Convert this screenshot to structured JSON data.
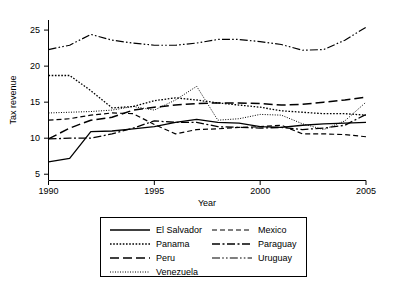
{
  "chart_data": {
    "type": "line",
    "title": "",
    "xlabel": "Year",
    "ylabel": "Tax revenue",
    "xlim": [
      1990,
      2005
    ],
    "ylim": [
      4.2,
      26.4
    ],
    "xticks": [
      1990,
      1995,
      2000,
      2005
    ],
    "yticks": [
      5,
      10,
      15,
      20,
      25
    ],
    "grid": false,
    "legend_position": "below-center",
    "x": [
      1990,
      1991,
      1992,
      1993,
      1994,
      1995,
      1996,
      1997,
      1998,
      1999,
      2000,
      2001,
      2002,
      2003,
      2004,
      2005
    ],
    "series": [
      {
        "name": "El Salvador",
        "style": "solid",
        "values": [
          6.7,
          7.2,
          10.9,
          11.0,
          11.3,
          11.6,
          12.2,
          12.6,
          12.2,
          12.1,
          11.6,
          11.5,
          11.8,
          12.0,
          12.1,
          12.2
        ]
      },
      {
        "name": "Panama",
        "style": "dotted",
        "values": [
          18.7,
          18.7,
          16.6,
          14.2,
          14.4,
          15.2,
          15.6,
          15.3,
          14.9,
          14.6,
          14.3,
          13.8,
          13.6,
          13.4,
          13.4,
          13.2
        ]
      },
      {
        "name": "Peru",
        "style": "long-dash",
        "values": [
          9.9,
          11.4,
          12.5,
          12.9,
          13.9,
          14.3,
          14.6,
          14.8,
          14.9,
          14.9,
          14.8,
          14.6,
          14.7,
          15.0,
          15.3,
          15.7
        ]
      },
      {
        "name": "Venezuela",
        "style": "fine-dotted",
        "values": [
          13.5,
          13.6,
          13.7,
          13.9,
          14.4,
          13.9,
          15.3,
          17.2,
          12.5,
          12.7,
          13.3,
          13.2,
          12.0,
          11.2,
          12.4,
          15.0
        ]
      },
      {
        "name": "Mexico",
        "style": "dashed",
        "values": [
          12.5,
          12.7,
          13.2,
          13.5,
          13.4,
          11.9,
          10.6,
          11.2,
          11.3,
          11.5,
          11.6,
          11.8,
          10.6,
          10.6,
          10.5,
          10.2
        ]
      },
      {
        "name": "Paraguay",
        "style": "dash-dot",
        "values": [
          9.9,
          10.0,
          10.0,
          10.6,
          11.4,
          12.4,
          12.2,
          12.2,
          11.6,
          11.5,
          11.4,
          11.5,
          11.2,
          11.4,
          11.8,
          13.3
        ]
      },
      {
        "name": "Uruguay",
        "style": "dash-dot-dot",
        "values": [
          22.3,
          22.9,
          24.4,
          23.6,
          23.2,
          22.9,
          22.9,
          23.2,
          23.7,
          23.7,
          23.4,
          23.0,
          22.2,
          22.3,
          23.6,
          25.4
        ]
      }
    ],
    "legend": [
      {
        "label": "El Salvador",
        "style": "solid"
      },
      {
        "label": "Mexico",
        "style": "dashed"
      },
      {
        "label": "Panama",
        "style": "dotted"
      },
      {
        "label": "Paraguay",
        "style": "dash-dot"
      },
      {
        "label": "Peru",
        "style": "long-dash"
      },
      {
        "label": "Uruguay",
        "style": "dash-dot-dot"
      },
      {
        "label": "Venezuela",
        "style": "fine-dotted"
      }
    ]
  },
  "axes": {
    "ylabel": "Tax revenue",
    "xlabel": "Year",
    "yticks": [
      "25",
      "20",
      "15",
      "10",
      "5"
    ],
    "xticks": [
      "1990",
      "1995",
      "2000",
      "2005"
    ]
  },
  "legend": {
    "entries": [
      "El Salvador",
      "Mexico",
      "Panama",
      "Paraguay",
      "Peru",
      "Uruguay",
      "Venezuela"
    ]
  },
  "colors": {
    "line": "#000000",
    "axis": "#000000",
    "background": "#ffffff"
  }
}
